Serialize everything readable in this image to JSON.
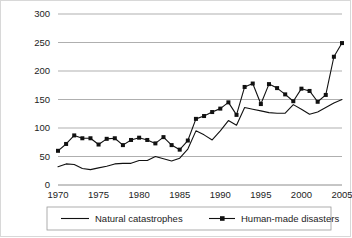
{
  "chart_data": {
    "type": "line",
    "title": "",
    "xlabel": "",
    "ylabel": "",
    "xlim": [
      1970,
      2005
    ],
    "ylim": [
      0,
      300
    ],
    "grid": true,
    "legend_position": "bottom",
    "x": [
      1970,
      1971,
      1972,
      1973,
      1974,
      1975,
      1976,
      1977,
      1978,
      1979,
      1980,
      1981,
      1982,
      1983,
      1984,
      1985,
      1986,
      1987,
      1988,
      1989,
      1990,
      1991,
      1992,
      1993,
      1994,
      1995,
      1996,
      1997,
      1998,
      1999,
      2000,
      2001,
      2002,
      2003,
      2004,
      2005
    ],
    "xtick_labels": [
      "1970",
      "1975",
      "1980",
      "1985",
      "1990",
      "1995",
      "2000",
      "2005"
    ],
    "xticks": [
      1970,
      1975,
      1980,
      1985,
      1990,
      1995,
      2000,
      2005
    ],
    "ytick_labels": [
      "0",
      "50",
      "100",
      "150",
      "200",
      "250",
      "300"
    ],
    "yticks": [
      0,
      50,
      100,
      150,
      200,
      250,
      300
    ],
    "series": [
      {
        "name": "Natural catastrophes",
        "marker": "none",
        "color": "#111111",
        "values": [
          32,
          37,
          36,
          29,
          27,
          30,
          33,
          37,
          38,
          38,
          43,
          43,
          50,
          46,
          42,
          47,
          63,
          95,
          88,
          79,
          95,
          113,
          105,
          136,
          133,
          130,
          127,
          126,
          126,
          141,
          133,
          124,
          128,
          136,
          144,
          150
        ]
      },
      {
        "name": "Human-made disasters",
        "marker": "square",
        "color": "#111111",
        "values": [
          60,
          72,
          87,
          82,
          82,
          71,
          81,
          82,
          70,
          79,
          83,
          79,
          73,
          84,
          70,
          62,
          78,
          116,
          121,
          128,
          134,
          145,
          123,
          172,
          178,
          142,
          177,
          170,
          159,
          147,
          169,
          165,
          146,
          158,
          225,
          249
        ]
      }
    ]
  },
  "legend": {
    "items": [
      {
        "label": "Natural catastrophes",
        "marker": "line"
      },
      {
        "label": "Human-made disasters",
        "marker": "line-square"
      }
    ]
  }
}
